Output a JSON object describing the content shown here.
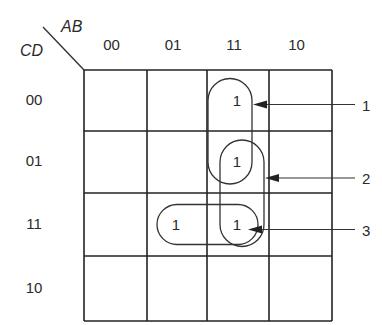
{
  "diagram": {
    "type": "karnaugh-map",
    "column_variable_label": "AB",
    "row_variable_label": "CD",
    "column_headers": [
      "00",
      "01",
      "11",
      "10"
    ],
    "row_headers": [
      "00",
      "01",
      "11",
      "10"
    ],
    "cells": [
      [
        "",
        "",
        "1",
        ""
      ],
      [
        "",
        "",
        "1",
        ""
      ],
      [
        "",
        "1",
        "1",
        ""
      ],
      [
        "",
        "",
        "",
        ""
      ]
    ],
    "groups": [
      {
        "label": "1",
        "cells": [
          [
            0,
            2
          ],
          [
            1,
            2
          ]
        ],
        "orientation": "vertical"
      },
      {
        "label": "2",
        "cells": [
          [
            1,
            2
          ],
          [
            2,
            2
          ]
        ],
        "orientation": "vertical"
      },
      {
        "label": "3",
        "cells": [
          [
            2,
            1
          ],
          [
            2,
            2
          ]
        ],
        "orientation": "horizontal"
      }
    ]
  }
}
